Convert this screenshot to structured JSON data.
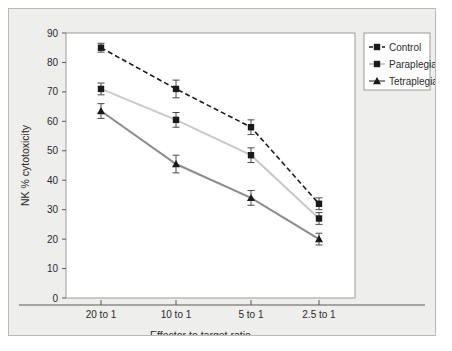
{
  "chart_data": {
    "type": "line",
    "title": "",
    "xlabel": "Effector to target ratio",
    "ylabel": "NK % cytotoxicity",
    "categories": [
      "20 to 1",
      "10 to 1",
      "5 to 1",
      "2.5 to 1"
    ],
    "ylim": [
      0,
      90
    ],
    "yticks": [
      0,
      10,
      20,
      30,
      40,
      50,
      60,
      70,
      80,
      90
    ],
    "grid": false,
    "legend_position": "right-top",
    "series": [
      {
        "name": "Control",
        "values": [
          85,
          71,
          58,
          32
        ],
        "errors": [
          1.5,
          3,
          2.5,
          2
        ],
        "color": "#1a1a1a",
        "line_style": "dashed",
        "marker": "square"
      },
      {
        "name": "Paraplegia",
        "values": [
          71,
          60.5,
          48.5,
          27
        ],
        "errors": [
          2,
          2.5,
          2.5,
          2
        ],
        "color": "#c9c9c9",
        "line_style": "solid",
        "marker": "square"
      },
      {
        "name": "Tetraplegia",
        "values": [
          63.5,
          45.5,
          34,
          20
        ],
        "errors": [
          2.5,
          3,
          2.5,
          2
        ],
        "color": "#8c8c8c",
        "line_style": "solid",
        "marker": "triangle"
      }
    ]
  }
}
